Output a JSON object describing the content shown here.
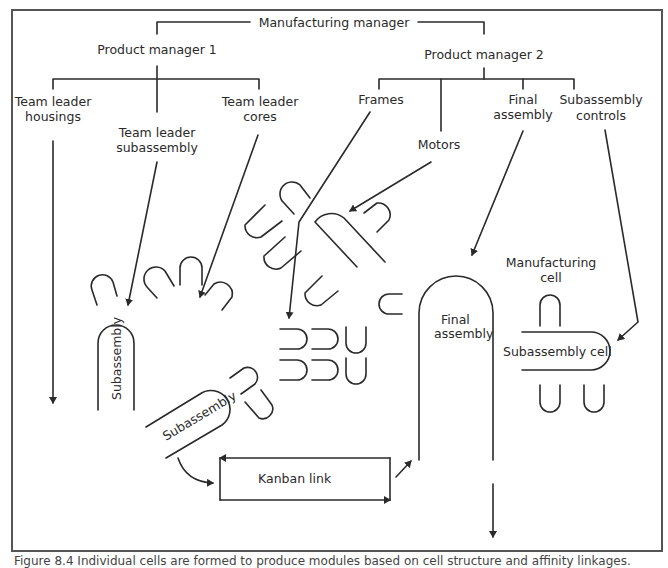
{
  "diagram": {
    "type": "organization-and-factory-layout",
    "colors": {
      "line": "#2a2a2a",
      "frame": "#555555",
      "background": "#ffffff"
    },
    "org_chart": {
      "root": "Manufacturing manager",
      "managers": [
        {
          "label": "Product manager 1",
          "reports": [
            {
              "line1": "Team leader",
              "line2": "housings"
            },
            {
              "line1": "Team leader",
              "line2": "subassembly"
            },
            {
              "line1": "Team leader",
              "line2": "cores"
            }
          ]
        },
        {
          "label": "Product manager 2",
          "reports": [
            {
              "line1": "Frames"
            },
            {
              "line1": "Motors"
            },
            {
              "line1": "Final",
              "line2": "assembly"
            },
            {
              "line1": "Subassembly",
              "line2": "controls"
            }
          ]
        }
      ]
    },
    "cells": {
      "subassembly_vertical": "Subassembly",
      "subassembly_diagonal": "Subassembly",
      "final_assembly_line1": "Final",
      "final_assembly_line2": "assembly",
      "manufacturing_cell_line1": "Manufacturing",
      "manufacturing_cell_line2": "cell",
      "subassembly_cell": "Subassembly cell",
      "kanban_link": "Kanban link"
    },
    "caption": "Figure 8.4 Individual cells are formed to produce modules based on cell structure and affinity linkages."
  }
}
